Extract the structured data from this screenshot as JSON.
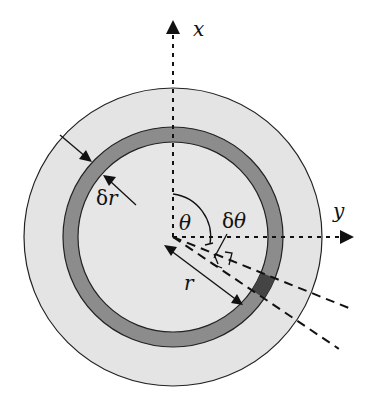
{
  "diagram": {
    "labels": {
      "x_axis": "x",
      "y_axis": "y",
      "theta": "θ",
      "delta_theta_prefix": "δ",
      "delta_theta_symbol": "θ",
      "delta_r_prefix": "δ",
      "delta_r_symbol": "r",
      "radius": "r"
    },
    "colors": {
      "background": "#ffffff",
      "outer_disk": "#e4e4e4",
      "ring": "#8c8c8c",
      "element": "#444444",
      "inner_disk": "#e6e6e6",
      "stroke": "#1a1a1a"
    },
    "angles_deg": {
      "theta": 112,
      "delta_theta": 12
    }
  }
}
